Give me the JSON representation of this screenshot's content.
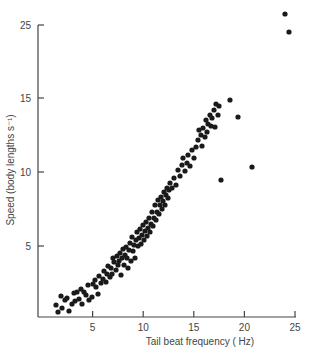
{
  "chart_data": {
    "type": "scatter",
    "title": "",
    "xlabel": "Tail beat frequency ( Hz)",
    "ylabel": "Speed (body lengths  s⁻¹)",
    "xlim": [
      0,
      25
    ],
    "ylim": [
      0,
      25
    ],
    "x_ticks": [
      5,
      10,
      15,
      20,
      25
    ],
    "y_ticks": [
      {
        "label": "5",
        "pos": 246
      },
      {
        "label": "10",
        "pos": 172
      },
      {
        "label": "15",
        "pos": 98
      },
      {
        "label": "25",
        "pos": 25
      }
    ],
    "grid": false,
    "legend": null,
    "marker_color": "#1a1a1a",
    "points_px": [
      [
        56,
        305
      ],
      [
        58,
        312
      ],
      [
        61,
        296
      ],
      [
        62,
        308
      ],
      [
        65,
        300
      ],
      [
        67,
        298
      ],
      [
        69,
        311
      ],
      [
        72,
        304
      ],
      [
        75,
        301
      ],
      [
        74,
        293
      ],
      [
        77,
        292
      ],
      [
        79,
        299
      ],
      [
        81,
        289
      ],
      [
        82,
        304
      ],
      [
        84,
        292
      ],
      [
        86,
        295
      ],
      [
        88,
        285
      ],
      [
        89,
        300
      ],
      [
        92,
        297
      ],
      [
        93,
        284
      ],
      [
        95,
        280
      ],
      [
        96,
        287
      ],
      [
        98,
        294
      ],
      [
        99,
        276
      ],
      [
        101,
        283
      ],
      [
        103,
        279
      ],
      [
        104,
        271
      ],
      [
        106,
        282
      ],
      [
        107,
        274
      ],
      [
        108,
        266
      ],
      [
        110,
        277
      ],
      [
        111,
        268
      ],
      [
        112,
        274
      ],
      [
        113,
        258
      ],
      [
        114,
        262
      ],
      [
        116,
        270
      ],
      [
        117,
        256
      ],
      [
        118,
        265
      ],
      [
        119,
        261
      ],
      [
        120,
        253
      ],
      [
        121,
        275
      ],
      [
        122,
        258
      ],
      [
        123,
        249
      ],
      [
        124,
        265
      ],
      [
        125,
        255
      ],
      [
        126,
        247
      ],
      [
        127,
        258
      ],
      [
        128,
        268
      ],
      [
        129,
        250
      ],
      [
        130,
        243
      ],
      [
        131,
        261
      ],
      [
        132,
        237
      ],
      [
        133,
        251
      ],
      [
        134,
        245
      ],
      [
        135,
        258
      ],
      [
        136,
        240
      ],
      [
        137,
        232
      ],
      [
        138,
        246
      ],
      [
        139,
        238
      ],
      [
        140,
        229
      ],
      [
        141,
        244
      ],
      [
        142,
        235
      ],
      [
        143,
        225
      ],
      [
        144,
        240
      ],
      [
        145,
        231
      ],
      [
        146,
        222
      ],
      [
        147,
        236
      ],
      [
        148,
        228
      ],
      [
        149,
        218
      ],
      [
        150,
        232
      ],
      [
        151,
        224
      ],
      [
        152,
        212
      ],
      [
        153,
        226
      ],
      [
        154,
        218
      ],
      [
        155,
        205
      ],
      [
        156,
        220
      ],
      [
        157,
        212
      ],
      [
        158,
        200
      ],
      [
        159,
        214
      ],
      [
        160,
        205
      ],
      [
        161,
        197
      ],
      [
        162,
        209
      ],
      [
        163,
        201
      ],
      [
        164,
        192
      ],
      [
        165,
        205
      ],
      [
        166,
        195
      ],
      [
        167,
        188
      ],
      [
        168,
        198
      ],
      [
        169,
        190
      ],
      [
        170,
        183
      ],
      [
        172,
        188
      ],
      [
        174,
        178
      ],
      [
        176,
        185
      ],
      [
        178,
        170
      ],
      [
        180,
        176
      ],
      [
        182,
        165
      ],
      [
        183,
        158
      ],
      [
        185,
        171
      ],
      [
        187,
        163
      ],
      [
        188,
        155
      ],
      [
        190,
        166
      ],
      [
        192,
        150
      ],
      [
        194,
        158
      ],
      [
        196,
        147
      ],
      [
        198,
        140
      ],
      [
        199,
        130
      ],
      [
        201,
        135
      ],
      [
        202,
        146
      ],
      [
        203,
        128
      ],
      [
        205,
        137
      ],
      [
        206,
        120
      ],
      [
        207,
        132
      ],
      [
        208,
        124
      ],
      [
        210,
        115
      ],
      [
        211,
        126
      ],
      [
        212,
        118
      ],
      [
        214,
        110
      ],
      [
        215,
        127
      ],
      [
        216,
        104
      ],
      [
        218,
        115
      ],
      [
        219,
        106
      ],
      [
        221,
        180
      ],
      [
        230,
        100
      ],
      [
        238,
        117
      ],
      [
        252,
        167
      ],
      [
        285,
        14
      ],
      [
        289,
        32
      ]
    ]
  }
}
